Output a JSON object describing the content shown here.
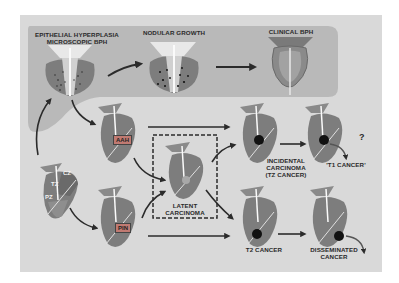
{
  "diagram": {
    "title_top_left": [
      "EPITHELIAL HYPERPLASIA",
      "MICROSCOPIC BPH"
    ],
    "title_top_middle": "NODULAR GROWTH",
    "title_top_right": "CLINICAL BPH",
    "zones": {
      "cz": "CZ",
      "tz": "TZ",
      "pz": "PZ"
    },
    "boxes": {
      "aah": "AAH",
      "pin": "PIN"
    },
    "latent": [
      "LATENT",
      "CARCINOMA"
    ],
    "incidental": [
      "INCIDENTAL",
      "CARCINOMA",
      "(TZ CANCER)"
    ],
    "t1": "'T1 CANCER'",
    "question": "?",
    "t2": "T2 CANCER",
    "disseminated": [
      "DISSEMINATED",
      "CANCER"
    ],
    "colors": {
      "frame": "#d9d9d9",
      "top_panel": "#b9b9b9",
      "gland": "#7d7d7d",
      "gland_dark": "#5e5e5e",
      "tumor": "#111111",
      "arrow": "#2b2b2b",
      "box": "#c07a72"
    }
  }
}
